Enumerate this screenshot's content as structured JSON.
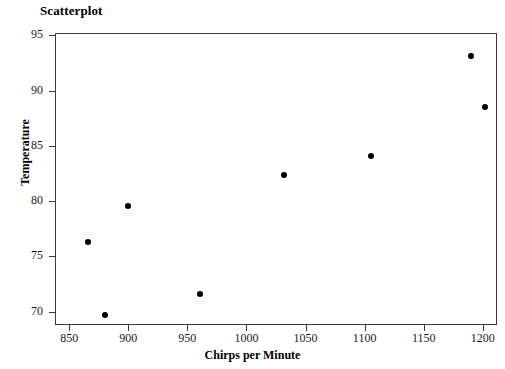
{
  "chart_data": {
    "type": "scatter",
    "title": "Scatterplot",
    "xlabel": "Chirps per Minute",
    "ylabel": "Temperature",
    "xlim": [
      838,
      1212
    ],
    "ylim": [
      68.8,
      95.2
    ],
    "xticks": [
      850,
      900,
      950,
      1000,
      1050,
      1100,
      1150,
      1200
    ],
    "yticks": [
      70,
      75,
      80,
      85,
      90,
      95
    ],
    "grid": false,
    "legend": null,
    "marker_color": "#000000",
    "frame_color": "#3a3a3a",
    "background": "#ffffff",
    "points": [
      {
        "x": 866,
        "y": 76.3
      },
      {
        "x": 880,
        "y": 69.7
      },
      {
        "x": 900,
        "y": 79.6
      },
      {
        "x": 961,
        "y": 71.6
      },
      {
        "x": 1032,
        "y": 82.4
      },
      {
        "x": 1105,
        "y": 84.1
      },
      {
        "x": 1190,
        "y": 93.1
      },
      {
        "x": 1202,
        "y": 88.5
      }
    ],
    "x_values": [
      866,
      880,
      900,
      961,
      1032,
      1105,
      1190,
      1202
    ],
    "y_values": [
      76.3,
      69.7,
      79.6,
      71.6,
      82.4,
      84.1,
      93.1,
      88.5
    ]
  }
}
